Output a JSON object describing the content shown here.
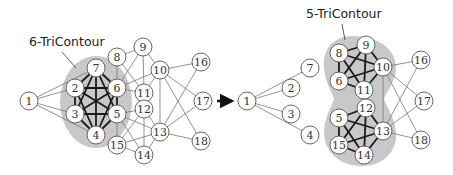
{
  "figure": {
    "left_graph": {
      "contour_label": "6-TriContour",
      "nodes": [
        {
          "id": "1",
          "x": 29,
          "y": 101
        },
        {
          "id": "2",
          "x": 75,
          "y": 88
        },
        {
          "id": "3",
          "x": 75,
          "y": 114
        },
        {
          "id": "4",
          "x": 96,
          "y": 135
        },
        {
          "id": "5",
          "x": 117,
          "y": 114
        },
        {
          "id": "6",
          "x": 117,
          "y": 88
        },
        {
          "id": "7",
          "x": 96,
          "y": 68
        },
        {
          "id": "8",
          "x": 117,
          "y": 57
        },
        {
          "id": "9",
          "x": 143,
          "y": 47
        },
        {
          "id": "10",
          "x": 160,
          "y": 70
        },
        {
          "id": "11",
          "x": 144,
          "y": 93
        },
        {
          "id": "12",
          "x": 144,
          "y": 109
        },
        {
          "id": "13",
          "x": 160,
          "y": 132
        },
        {
          "id": "14",
          "x": 144,
          "y": 155
        },
        {
          "id": "15",
          "x": 117,
          "y": 145
        },
        {
          "id": "16",
          "x": 201,
          "y": 62
        },
        {
          "id": "17",
          "x": 203,
          "y": 101
        },
        {
          "id": "18",
          "x": 201,
          "y": 141
        }
      ],
      "thick_edges": [
        [
          "7",
          "2"
        ],
        [
          "7",
          "3"
        ],
        [
          "7",
          "4"
        ],
        [
          "7",
          "5"
        ],
        [
          "7",
          "6"
        ],
        [
          "2",
          "3"
        ],
        [
          "2",
          "4"
        ],
        [
          "2",
          "5"
        ],
        [
          "2",
          "6"
        ],
        [
          "3",
          "4"
        ],
        [
          "3",
          "5"
        ],
        [
          "3",
          "6"
        ],
        [
          "4",
          "5"
        ],
        [
          "4",
          "6"
        ],
        [
          "5",
          "6"
        ]
      ],
      "thin_edges": [
        [
          "1",
          "7"
        ],
        [
          "1",
          "2"
        ],
        [
          "1",
          "3"
        ],
        [
          "1",
          "4"
        ],
        [
          "8",
          "6"
        ],
        [
          "8",
          "9"
        ],
        [
          "8",
          "11"
        ],
        [
          "9",
          "6"
        ],
        [
          "9",
          "10"
        ],
        [
          "9",
          "11"
        ],
        [
          "10",
          "6"
        ],
        [
          "10",
          "11"
        ],
        [
          "6",
          "11"
        ],
        [
          "5",
          "12"
        ],
        [
          "5",
          "13"
        ],
        [
          "5",
          "14"
        ],
        [
          "5",
          "15"
        ],
        [
          "12",
          "13"
        ],
        [
          "12",
          "14"
        ],
        [
          "12",
          "15"
        ],
        [
          "13",
          "15"
        ],
        [
          "13",
          "14"
        ],
        [
          "14",
          "15"
        ],
        [
          "10",
          "13"
        ],
        [
          "10",
          "16"
        ],
        [
          "10",
          "17"
        ],
        [
          "10",
          "18"
        ],
        [
          "13",
          "16"
        ],
        [
          "13",
          "17"
        ],
        [
          "13",
          "18"
        ]
      ]
    },
    "arrow": {
      "direction": "right"
    },
    "right_graph": {
      "contour_label": "5-TriContour",
      "nodes": [
        {
          "id": "1",
          "x": 247,
          "y": 101
        },
        {
          "id": "7",
          "x": 310,
          "y": 68
        },
        {
          "id": "2",
          "x": 291,
          "y": 88
        },
        {
          "id": "3",
          "x": 291,
          "y": 114
        },
        {
          "id": "4",
          "x": 310,
          "y": 135
        },
        {
          "id": "8",
          "x": 339,
          "y": 53
        },
        {
          "id": "9",
          "x": 366,
          "y": 45
        },
        {
          "id": "10",
          "x": 383,
          "y": 67
        },
        {
          "id": "6",
          "x": 339,
          "y": 81
        },
        {
          "id": "11",
          "x": 364,
          "y": 90
        },
        {
          "id": "5",
          "x": 339,
          "y": 118
        },
        {
          "id": "12",
          "x": 366,
          "y": 108
        },
        {
          "id": "13",
          "x": 383,
          "y": 131
        },
        {
          "id": "15",
          "x": 339,
          "y": 145
        },
        {
          "id": "14",
          "x": 364,
          "y": 155
        },
        {
          "id": "16",
          "x": 421,
          "y": 60
        },
        {
          "id": "17",
          "x": 424,
          "y": 101
        },
        {
          "id": "18",
          "x": 421,
          "y": 140
        }
      ],
      "thick_edges": [
        [
          "8",
          "9"
        ],
        [
          "8",
          "10"
        ],
        [
          "8",
          "6"
        ],
        [
          "8",
          "11"
        ],
        [
          "9",
          "10"
        ],
        [
          "9",
          "6"
        ],
        [
          "9",
          "11"
        ],
        [
          "10",
          "6"
        ],
        [
          "10",
          "11"
        ],
        [
          "6",
          "11"
        ],
        [
          "5",
          "12"
        ],
        [
          "5",
          "13"
        ],
        [
          "5",
          "15"
        ],
        [
          "5",
          "14"
        ],
        [
          "12",
          "13"
        ],
        [
          "12",
          "15"
        ],
        [
          "12",
          "14"
        ],
        [
          "13",
          "15"
        ],
        [
          "13",
          "14"
        ],
        [
          "15",
          "14"
        ]
      ],
      "thin_edges": [
        [
          "1",
          "7"
        ],
        [
          "1",
          "2"
        ],
        [
          "1",
          "3"
        ],
        [
          "1",
          "4"
        ],
        [
          "10",
          "13"
        ],
        [
          "10",
          "16"
        ],
        [
          "10",
          "17"
        ],
        [
          "10",
          "18"
        ],
        [
          "13",
          "16"
        ],
        [
          "13",
          "17"
        ],
        [
          "13",
          "18"
        ]
      ]
    }
  }
}
